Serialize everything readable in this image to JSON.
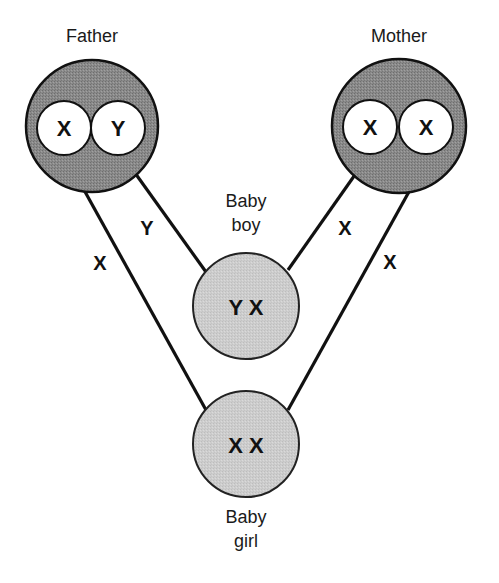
{
  "diagram": {
    "colors": {
      "parent_fill": "#8c8c8c",
      "child_fill": "#cfcfcf",
      "chromosome_fill": "#ffffff",
      "line": "#111111"
    },
    "parents": {
      "father": {
        "label": "Father",
        "chromosomes": [
          "X",
          "Y"
        ]
      },
      "mother": {
        "label": "Mother",
        "chromosomes": [
          "X",
          "X"
        ]
      }
    },
    "children": {
      "boy": {
        "label_line1": "Baby",
        "label_line2": "boy",
        "genotype": "Y X"
      },
      "girl": {
        "label_line1": "Baby",
        "label_line2": "girl",
        "genotype": "X X"
      }
    },
    "edges": [
      {
        "from": "father.X",
        "to": "girl",
        "label": "X"
      },
      {
        "from": "father.Y",
        "to": "boy",
        "label": "Y"
      },
      {
        "from": "mother.X1",
        "to": "boy",
        "label": "X"
      },
      {
        "from": "mother.X2",
        "to": "girl",
        "label": "X"
      }
    ]
  }
}
